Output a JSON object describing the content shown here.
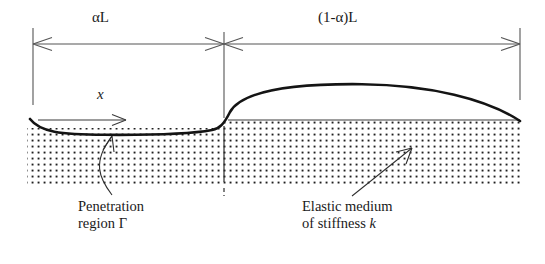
{
  "figure": {
    "name": "beam-on-elastic-foundation-diagram",
    "background_color": "#ffffff",
    "line_color": "#2a2a2a",
    "dim_line_color": "#555555",
    "medium_dot_color": "#1f1f1f"
  },
  "dimensions": {
    "left_segment_label": "αL",
    "right_segment_label": "(1-α)L",
    "left_extension_x": 33,
    "mid_extension_x": 224,
    "right_extension_x": 520,
    "dimension_line_y": 44
  },
  "axis": {
    "label": "x",
    "arrow_start_x": 38,
    "arrow_end_x": 126,
    "arrow_y": 120,
    "label_x": 97,
    "label_y": 95
  },
  "callouts": [
    {
      "name": "penetration-region",
      "line1": "Penetration",
      "line2": "region Γ",
      "text_x": 78,
      "text_y": 206
    },
    {
      "name": "elastic-medium",
      "line1": "Elastic medium",
      "line2": "of stiffness k",
      "italic_tail": "k",
      "text_x": 302,
      "text_y": 206
    }
  ],
  "medium": {
    "surface_y": 128,
    "bottom_y": 186,
    "left_x": 27,
    "right_x": 520,
    "pattern": "square-dot-grid",
    "dot_spacing": 6
  },
  "beam_curve": {
    "description": "deflected beam: dips below surface in penetration region, rises and arches over elastic medium",
    "left_x": 30,
    "contact_dip_y": 134,
    "rise_x": 224,
    "peak_y": 85,
    "peak_x": 360,
    "right_x": 520,
    "right_y": 124
  }
}
